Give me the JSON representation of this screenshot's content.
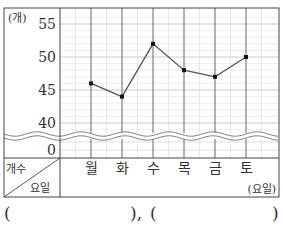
{
  "chart_data": {
    "type": "line",
    "title": "",
    "xlabel": "요일",
    "ylabel": "개수",
    "y_unit_label": "(개)",
    "x_unit_label": "(요일)",
    "corner_header": {
      "top": "개수",
      "bottom": "요일"
    },
    "categories": [
      "월",
      "화",
      "수",
      "목",
      "금",
      "토"
    ],
    "values": [
      46,
      44,
      52,
      48,
      47,
      50
    ],
    "y_ticks": [
      0,
      40,
      45,
      50,
      55
    ],
    "ylim": [
      40,
      56
    ],
    "axis_break": true,
    "grid": true,
    "minor_grid_step": 1,
    "line_color": "#555555",
    "marker_color": "#111111"
  },
  "answer_blanks": {
    "open1": "(",
    "close1": "),",
    "open2": "(",
    "close2": ")"
  }
}
